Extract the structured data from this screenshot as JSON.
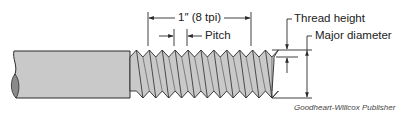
{
  "diagram": {
    "labels": {
      "length": "1″ (8 tpi)",
      "pitch": "Pitch",
      "thread_height": "Thread height",
      "major_diameter": "Major diameter"
    },
    "credit": "Goodheart-Willcox Publisher",
    "colors": {
      "fill": "#c9c9c9",
      "end_fill": "#8a8a8a",
      "line": "#2a2a2a"
    },
    "threads_per_inch": 8
  }
}
